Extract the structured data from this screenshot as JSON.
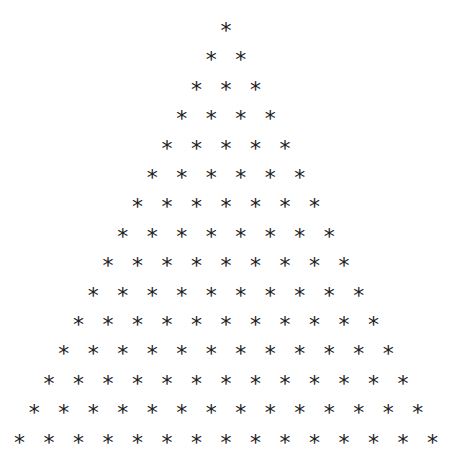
{
  "pattern": {
    "type": "asterisk-triangle",
    "glyph": "*",
    "rows": 15,
    "row_counts": [
      1,
      2,
      3,
      4,
      5,
      6,
      7,
      8,
      9,
      10,
      11,
      12,
      13,
      14,
      15
    ],
    "color": "#222222",
    "background": "#ffffff",
    "apex_x": 226,
    "first_row_y": 26,
    "row_spacing_y": 29.4,
    "col_spacing_x": 29.5
  }
}
